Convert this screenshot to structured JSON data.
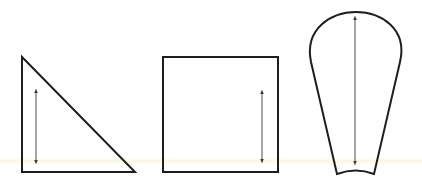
{
  "diagram": {
    "colors": {
      "outline": "#1e1e1e",
      "arrow": "#6a6a6a",
      "background": "#ffffff"
    },
    "shapes": [
      {
        "name": "right-triangle",
        "points": "22,57 22,172 135,172",
        "arrow": {
          "x": 36,
          "y1": 91,
          "y2": 162
        }
      },
      {
        "name": "square",
        "rect": {
          "x": 163,
          "y": 57,
          "w": 115,
          "h": 115
        },
        "arrow": {
          "x": 262,
          "y1": 92,
          "y2": 161
        }
      },
      {
        "name": "rounded-tapered-shape",
        "path": "M 337 174 L 311 62 C 304 28 332 12 356 12 C 380 12 408 28 400 62 L 374 174 Q 356 167 337 174 Z",
        "arrow": {
          "x": 355,
          "y1": 18,
          "y2": 163
        }
      }
    ]
  }
}
